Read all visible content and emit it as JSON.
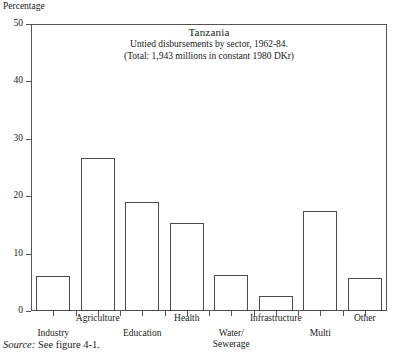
{
  "figure": {
    "yaxis_caption": "Percentage",
    "source_label": "Source:",
    "source_text": "See figure 4-1."
  },
  "chart_data": {
    "type": "bar",
    "title": "Tanzania",
    "subtitle": "Untied disbursements by sector, 1962-84.",
    "note": "(Total: 1,943 millions in constant 1980 DKr)",
    "xlabel": "",
    "ylabel": "Percentage",
    "ylim": [
      0,
      50
    ],
    "yticks": [
      0,
      10,
      20,
      30,
      40,
      50
    ],
    "ytick_labels": [
      "0",
      "10",
      "20",
      "30",
      "40",
      "50"
    ],
    "grid": false,
    "legend": "none",
    "categories": [
      "Industry",
      "Agriculture",
      "Education",
      "Health",
      "Water/ Sewerage",
      "Infrastructure",
      "Multi",
      "Other"
    ],
    "category_lines": [
      [
        "Industry"
      ],
      [
        "Agriculture"
      ],
      [
        "Education"
      ],
      [
        "Health"
      ],
      [
        "Water/",
        "Sewerage"
      ],
      [
        "Infrastructure"
      ],
      [
        "Multi"
      ],
      [
        "Other"
      ]
    ],
    "values": [
      6.1,
      26.6,
      19.0,
      15.4,
      6.3,
      2.6,
      17.5,
      5.8
    ],
    "bar_color": "#ffffff",
    "bar_edge_color": "#4a4a4a",
    "axis_color": "#555555"
  }
}
